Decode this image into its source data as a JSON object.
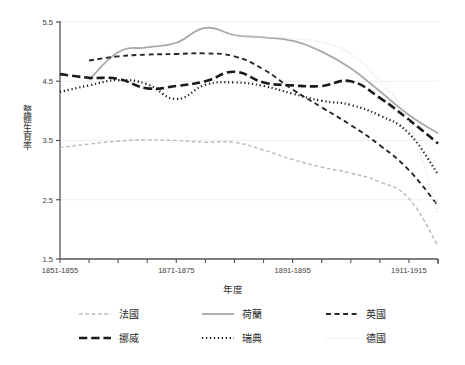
{
  "chart_data": {
    "type": "line",
    "title": "",
    "xlabel": "年度",
    "ylabel": "整體生育率",
    "ylim": [
      1.5,
      5.5
    ],
    "yticks": [
      "1.5",
      "2.5",
      "3.5",
      "4.5",
      "5.5"
    ],
    "grid": true,
    "legend_position": "bottom",
    "categories": [
      "1851-1855",
      "1856-1860",
      "1861-1865",
      "1866-1870",
      "1871-1875",
      "1876-1880",
      "1881-1885",
      "1886-1890",
      "1891-1895",
      "1896-1900",
      "1901-1905",
      "1906-1910",
      "1911-1915",
      "1916-1920"
    ],
    "xticks_labeled": [
      "1851-1855",
      "1871-1875",
      "1891-1895",
      "1911-1915"
    ],
    "series": [
      {
        "name": "法國",
        "color": "#b9b9b9",
        "style": "dashed",
        "width": 1.4,
        "values": [
          3.38,
          3.44,
          3.49,
          3.51,
          3.5,
          3.47,
          3.47,
          3.34,
          3.18,
          3.05,
          2.95,
          2.8,
          2.52,
          1.72
        ]
      },
      {
        "name": "荷蘭",
        "color": "#a9a9a9",
        "style": "solid",
        "width": 1.8,
        "values": [
          null,
          4.52,
          4.99,
          5.07,
          5.15,
          5.4,
          5.28,
          5.24,
          5.18,
          5.0,
          4.72,
          4.33,
          3.93,
          3.62
        ]
      },
      {
        "name": "英國",
        "color": "#262626",
        "style": "dashed",
        "width": 1.9,
        "values": [
          null,
          4.85,
          4.92,
          4.95,
          4.96,
          4.97,
          4.92,
          4.7,
          4.36,
          4.06,
          3.76,
          3.42,
          3.0,
          2.4
        ]
      },
      {
        "name": "挪威",
        "color": "#1a1a1a",
        "style": "long-dashed",
        "width": 2.6,
        "values": [
          4.62,
          4.56,
          4.54,
          4.38,
          4.42,
          4.5,
          4.66,
          4.48,
          4.43,
          4.42,
          4.5,
          4.22,
          3.85,
          3.45
        ]
      },
      {
        "name": "瑞典",
        "color": "#151515",
        "style": "dotted",
        "width": 2.2,
        "values": [
          4.32,
          4.43,
          4.52,
          4.45,
          4.2,
          4.44,
          4.48,
          4.42,
          4.29,
          4.17,
          4.1,
          3.92,
          3.62,
          2.93
        ]
      },
      {
        "name": "德國",
        "color": "#dedede",
        "style": "dotted",
        "width": 1.7,
        "values": [
          null,
          null,
          null,
          null,
          null,
          null,
          5.28,
          5.25,
          5.22,
          5.16,
          4.96,
          4.5,
          3.8,
          2.27
        ]
      }
    ]
  },
  "axes": {
    "y_label": "整體生育率",
    "x_label": "年度"
  },
  "legend": {
    "items": [
      {
        "label": "法國",
        "swatch": "dashed-light-line-icon"
      },
      {
        "label": "荷蘭",
        "swatch": "solid-gray-line-icon"
      },
      {
        "label": "英國",
        "swatch": "dashed-dark-line-icon"
      },
      {
        "label": "挪威",
        "swatch": "long-dashed-black-line-icon"
      },
      {
        "label": "瑞典",
        "swatch": "dotted-black-line-icon"
      },
      {
        "label": "德國",
        "swatch": "dotted-light-line-icon"
      }
    ]
  }
}
